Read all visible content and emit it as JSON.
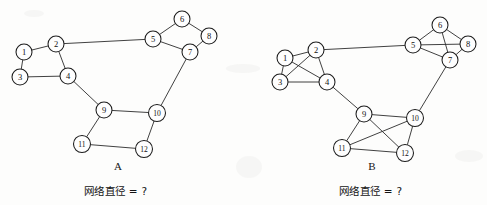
{
  "figure": {
    "background_color": "#fdfdfc",
    "ink_color": "#1c1c1c",
    "panels": [
      {
        "id": "A",
        "letter": "A",
        "letter_pos": {
          "x": 118,
          "y": 170
        },
        "caption": "网络直径 = ?",
        "caption_pos": {
          "x": 84,
          "y": 183
        },
        "nodes": [
          {
            "id": "1",
            "label": "1",
            "x": 24,
            "y": 52,
            "r": 8
          },
          {
            "id": "2",
            "label": "2",
            "x": 56,
            "y": 44,
            "r": 8
          },
          {
            "id": "3",
            "label": "3",
            "x": 20,
            "y": 77,
            "r": 8
          },
          {
            "id": "4",
            "label": "4",
            "x": 68,
            "y": 76,
            "r": 8
          },
          {
            "id": "5",
            "label": "5",
            "x": 153,
            "y": 39,
            "r": 8
          },
          {
            "id": "6",
            "label": "6",
            "x": 182,
            "y": 19,
            "r": 8
          },
          {
            "id": "7",
            "label": "7",
            "x": 190,
            "y": 52,
            "r": 8
          },
          {
            "id": "8",
            "label": "8",
            "x": 209,
            "y": 36,
            "r": 8
          },
          {
            "id": "9",
            "label": "9",
            "x": 104,
            "y": 110,
            "r": 8
          },
          {
            "id": "10",
            "label": "10",
            "x": 157,
            "y": 113,
            "r": 8.5
          },
          {
            "id": "11",
            "label": "11",
            "x": 82,
            "y": 144,
            "r": 8.5
          },
          {
            "id": "12",
            "label": "12",
            "x": 144,
            "y": 149,
            "r": 8.5
          }
        ],
        "edges": [
          [
            "1",
            "2"
          ],
          [
            "1",
            "3"
          ],
          [
            "2",
            "4"
          ],
          [
            "3",
            "4"
          ],
          [
            "2",
            "5"
          ],
          [
            "5",
            "6"
          ],
          [
            "5",
            "7"
          ],
          [
            "6",
            "8"
          ],
          [
            "7",
            "8"
          ],
          [
            "4",
            "9"
          ],
          [
            "7",
            "10"
          ],
          [
            "9",
            "10"
          ],
          [
            "9",
            "11"
          ],
          [
            "11",
            "12"
          ],
          [
            "10",
            "12"
          ]
        ],
        "edge_count": 15
      },
      {
        "id": "B",
        "letter": "B",
        "letter_pos": {
          "x": 372,
          "y": 170
        },
        "caption": "网络直径 = ?",
        "caption_pos": {
          "x": 339,
          "y": 183
        },
        "nodes": [
          {
            "id": "1",
            "label": "1",
            "x": 285,
            "y": 58,
            "r": 8
          },
          {
            "id": "2",
            "label": "2",
            "x": 316,
            "y": 50,
            "r": 8
          },
          {
            "id": "3",
            "label": "3",
            "x": 280,
            "y": 82,
            "r": 8
          },
          {
            "id": "4",
            "label": "4",
            "x": 327,
            "y": 82,
            "r": 8
          },
          {
            "id": "5",
            "label": "5",
            "x": 413,
            "y": 45,
            "r": 8
          },
          {
            "id": "6",
            "label": "6",
            "x": 440,
            "y": 25,
            "r": 8
          },
          {
            "id": "7",
            "label": "7",
            "x": 450,
            "y": 60,
            "r": 8
          },
          {
            "id": "8",
            "label": "8",
            "x": 468,
            "y": 44,
            "r": 8
          },
          {
            "id": "9",
            "label": "9",
            "x": 364,
            "y": 114,
            "r": 8
          },
          {
            "id": "10",
            "label": "10",
            "x": 415,
            "y": 118,
            "r": 8.5
          },
          {
            "id": "11",
            "label": "11",
            "x": 342,
            "y": 148,
            "r": 8.5
          },
          {
            "id": "12",
            "label": "12",
            "x": 405,
            "y": 153,
            "r": 8.5
          }
        ],
        "edges": [
          [
            "1",
            "2"
          ],
          [
            "1",
            "3"
          ],
          [
            "1",
            "4"
          ],
          [
            "2",
            "3"
          ],
          [
            "2",
            "4"
          ],
          [
            "3",
            "4"
          ],
          [
            "2",
            "5"
          ],
          [
            "5",
            "6"
          ],
          [
            "5",
            "7"
          ],
          [
            "5",
            "8"
          ],
          [
            "6",
            "7"
          ],
          [
            "6",
            "8"
          ],
          [
            "7",
            "8"
          ],
          [
            "4",
            "9"
          ],
          [
            "7",
            "10"
          ],
          [
            "9",
            "10"
          ],
          [
            "9",
            "11"
          ],
          [
            "9",
            "12"
          ],
          [
            "10",
            "11"
          ],
          [
            "10",
            "12"
          ],
          [
            "11",
            "12"
          ]
        ],
        "edge_count": 21
      }
    ]
  },
  "chart_data": {
    "type": "diagram",
    "title": "",
    "subtitle": "",
    "question": "网络直径 = ?",
    "graphs": [
      {
        "name": "A",
        "node_count": 12,
        "nodes": [
          "1",
          "2",
          "3",
          "4",
          "5",
          "6",
          "7",
          "8",
          "9",
          "10",
          "11",
          "12"
        ],
        "edges": [
          [
            "1",
            "2"
          ],
          [
            "1",
            "3"
          ],
          [
            "2",
            "4"
          ],
          [
            "3",
            "4"
          ],
          [
            "2",
            "5"
          ],
          [
            "5",
            "6"
          ],
          [
            "5",
            "7"
          ],
          [
            "6",
            "8"
          ],
          [
            "7",
            "8"
          ],
          [
            "4",
            "9"
          ],
          [
            "7",
            "10"
          ],
          [
            "9",
            "10"
          ],
          [
            "9",
            "11"
          ],
          [
            "11",
            "12"
          ],
          [
            "10",
            "12"
          ]
        ],
        "edge_count": 15
      },
      {
        "name": "B",
        "node_count": 12,
        "nodes": [
          "1",
          "2",
          "3",
          "4",
          "5",
          "6",
          "7",
          "8",
          "9",
          "10",
          "11",
          "12"
        ],
        "edges": [
          [
            "1",
            "2"
          ],
          [
            "1",
            "3"
          ],
          [
            "1",
            "4"
          ],
          [
            "2",
            "3"
          ],
          [
            "2",
            "4"
          ],
          [
            "3",
            "4"
          ],
          [
            "2",
            "5"
          ],
          [
            "5",
            "6"
          ],
          [
            "5",
            "7"
          ],
          [
            "5",
            "8"
          ],
          [
            "6",
            "7"
          ],
          [
            "6",
            "8"
          ],
          [
            "7",
            "8"
          ],
          [
            "4",
            "9"
          ],
          [
            "7",
            "10"
          ],
          [
            "9",
            "10"
          ],
          [
            "9",
            "11"
          ],
          [
            "9",
            "12"
          ],
          [
            "10",
            "11"
          ],
          [
            "10",
            "12"
          ],
          [
            "11",
            "12"
          ]
        ],
        "edge_count": 21
      }
    ]
  }
}
